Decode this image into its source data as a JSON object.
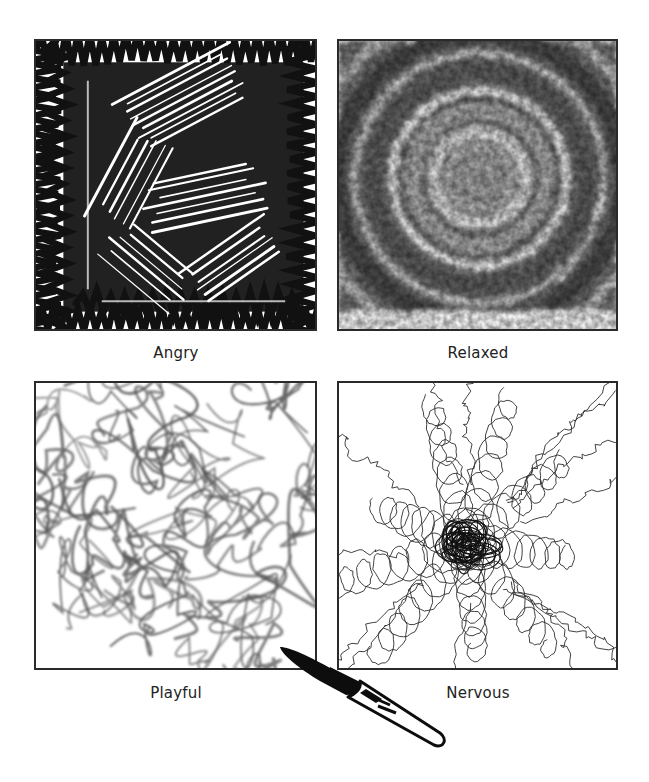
{
  "figure": {
    "panels": [
      {
        "id": "angry",
        "label": "Angry",
        "style": "dense heavy black cross-hatched scribbles in a square frame"
      },
      {
        "id": "relaxed",
        "label": "Relaxed",
        "style": "soft blurred grey concentric circular rings"
      },
      {
        "id": "playful",
        "label": "Playful",
        "style": "loose grey looping curvy lines"
      },
      {
        "id": "nervous",
        "label": "Nervous",
        "style": "thin tangled spirals radiating from a dark center"
      }
    ],
    "colors": {
      "ink": "#111111",
      "soft_grey": "#555555",
      "frame": "#2a2a2a",
      "caption": "#222222",
      "background": "#ffffff"
    },
    "decoration": {
      "icon": "paintbrush-icon"
    }
  }
}
